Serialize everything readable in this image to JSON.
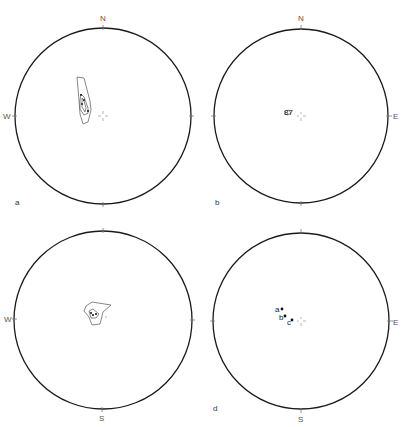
{
  "figure": {
    "panels": [
      {
        "id": "a",
        "label": "a",
        "center": [
          103,
          116
        ],
        "radius": 88,
        "directions": {
          "top": "N",
          "left": "W",
          "right": "",
          "bottom": ""
        },
        "content": "contoured girdle elongated N-S, NW of center"
      },
      {
        "id": "b",
        "label": "b",
        "center": [
          301,
          116
        ],
        "radius": 87,
        "directions": {
          "top": "N",
          "left": "",
          "right": "E",
          "bottom": ""
        },
        "annotation": "87",
        "content": "small cluster NW of center labeled 87"
      },
      {
        "id": "c",
        "label": "",
        "center": [
          103,
          320
        ],
        "radius": 89,
        "directions": {
          "top": "",
          "left": "W",
          "right": "",
          "bottom": "S"
        },
        "content": "contoured polygon cluster slightly NW of center"
      },
      {
        "id": "d",
        "label": "d",
        "center": [
          301,
          321
        ],
        "radius": 88,
        "directions": {
          "top": "",
          "left": "",
          "right": "E",
          "bottom": "S"
        },
        "points": [
          {
            "label": "a",
            "x": 282,
            "y": 309
          },
          {
            "label": "b",
            "x": 285,
            "y": 316
          },
          {
            "label": "c",
            "x": 292,
            "y": 320
          }
        ]
      }
    ]
  }
}
